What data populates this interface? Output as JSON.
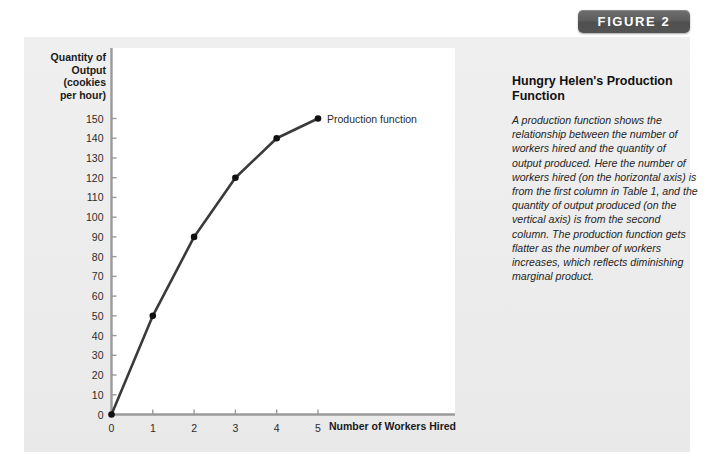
{
  "figure": {
    "badge_label": "FIGURE 2"
  },
  "caption": {
    "heading": "Hungry Helen's Production Function",
    "body": "A production function shows the relationship between the number of workers hired and the quantity of output produced. Here the number of workers hired (on the horizontal axis) is from the first column in Table 1, and the quantity of output produced (on the vertical axis) is from the second column. The production function gets flatter as the number of workers increases, which reflects diminishing marginal product."
  },
  "chart_data": {
    "type": "line",
    "title": "",
    "xlabel": "Number of Workers Hired",
    "ylabel": "Quantity of\nOutput\n(cookies\nper hour)",
    "ylabel_lines": [
      "Quantity of",
      "Output",
      "(cookies",
      "per hour)"
    ],
    "series": [
      {
        "name": "Production function",
        "x": [
          0,
          1,
          2,
          3,
          4,
          5
        ],
        "values": [
          0,
          50,
          90,
          120,
          140,
          150
        ],
        "marker": "filled-circle",
        "color": "#3a3a3a"
      }
    ],
    "x": [
      0,
      1,
      2,
      3,
      4,
      5
    ],
    "xtick_labels": [
      "0",
      "1",
      "2",
      "3",
      "4",
      "5"
    ],
    "ytick_labels": [
      "150",
      "140",
      "130",
      "120",
      "110",
      "100",
      "90",
      "80",
      "70",
      "60",
      "50",
      "40",
      "30",
      "20",
      "10",
      "0"
    ],
    "ytick_values": [
      150,
      140,
      130,
      120,
      110,
      100,
      90,
      80,
      70,
      60,
      50,
      40,
      30,
      20,
      10,
      0
    ],
    "xlim": [
      0,
      5.35
    ],
    "ylim": [
      0,
      158
    ],
    "grid": false,
    "legend_position": "inline-annotation",
    "annotations": [
      {
        "text": "Production function",
        "x": 5,
        "y": 150,
        "anchor": "right-of-point"
      }
    ]
  },
  "colors": {
    "panel_background": "#ededed",
    "plot_background": "#ffffff",
    "axis": "#8a8a8a",
    "curve": "#3a3a3a",
    "badge": "#5d5d5d",
    "badge_text": "#ffffff",
    "text": "#1a1a1a"
  }
}
